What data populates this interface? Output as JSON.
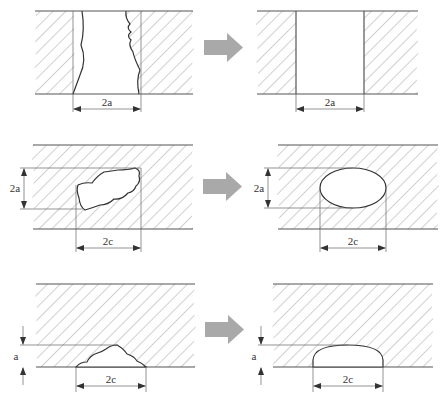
{
  "figure": {
    "colors": {
      "line": "#555555",
      "hatch": "#8a8a8a",
      "arrow": "#a9a9a9",
      "background": "#ffffff"
    },
    "rows": [
      {
        "name": "through-thickness",
        "before": {
          "flaw_shape": "irregular through-hole",
          "dimension_labels": {
            "width": "2a"
          }
        },
        "after": {
          "flaw_shape": "rectangular through-crack",
          "dimension_labels": {
            "width": "2a"
          }
        }
      },
      {
        "name": "embedded",
        "before": {
          "flaw_shape": "irregular embedded flaw",
          "dimension_labels": {
            "height": "2a",
            "width": "2c"
          }
        },
        "after": {
          "flaw_shape": "elliptical embedded crack",
          "dimension_labels": {
            "height": "2a",
            "width": "2c"
          }
        }
      },
      {
        "name": "surface",
        "before": {
          "flaw_shape": "irregular surface flaw",
          "dimension_labels": {
            "depth": "a",
            "width": "2c"
          }
        },
        "after": {
          "flaw_shape": "semi-elliptical surface crack",
          "dimension_labels": {
            "depth": "a",
            "width": "2c"
          }
        }
      }
    ],
    "arrow_icon": "right-arrow-icon"
  },
  "labels": {
    "r1_left_width": "2a",
    "r1_right_width": "2a",
    "r2_left_height": "2a",
    "r2_left_width": "2c",
    "r2_right_height": "2a",
    "r2_right_width": "2c",
    "r3_left_depth": "a",
    "r3_left_width": "2c",
    "r3_right_depth": "a",
    "r3_right_width": "2c"
  }
}
